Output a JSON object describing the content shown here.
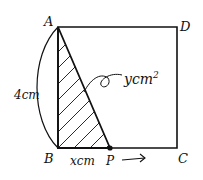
{
  "diagram": {
    "type": "geometry-square-moving-point",
    "vertices": {
      "A": "A",
      "B": "B",
      "C": "C",
      "D": "D",
      "P": "P"
    },
    "side_label": "4cm",
    "segment_label": "xcm",
    "area_label": "ycm",
    "area_exponent": "2",
    "direction_arrow": "P moves toward C",
    "colors": {
      "stroke": "#111111",
      "background": "#ffffff"
    }
  }
}
